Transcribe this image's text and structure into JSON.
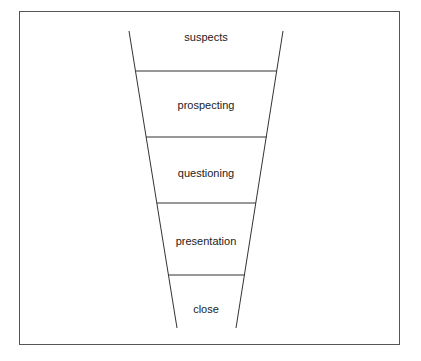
{
  "diagram": {
    "type": "funnel",
    "stages": [
      {
        "label": "suspects"
      },
      {
        "label": "prospecting"
      },
      {
        "label": "questioning"
      },
      {
        "label": "presentation"
      },
      {
        "label": "close"
      }
    ]
  }
}
